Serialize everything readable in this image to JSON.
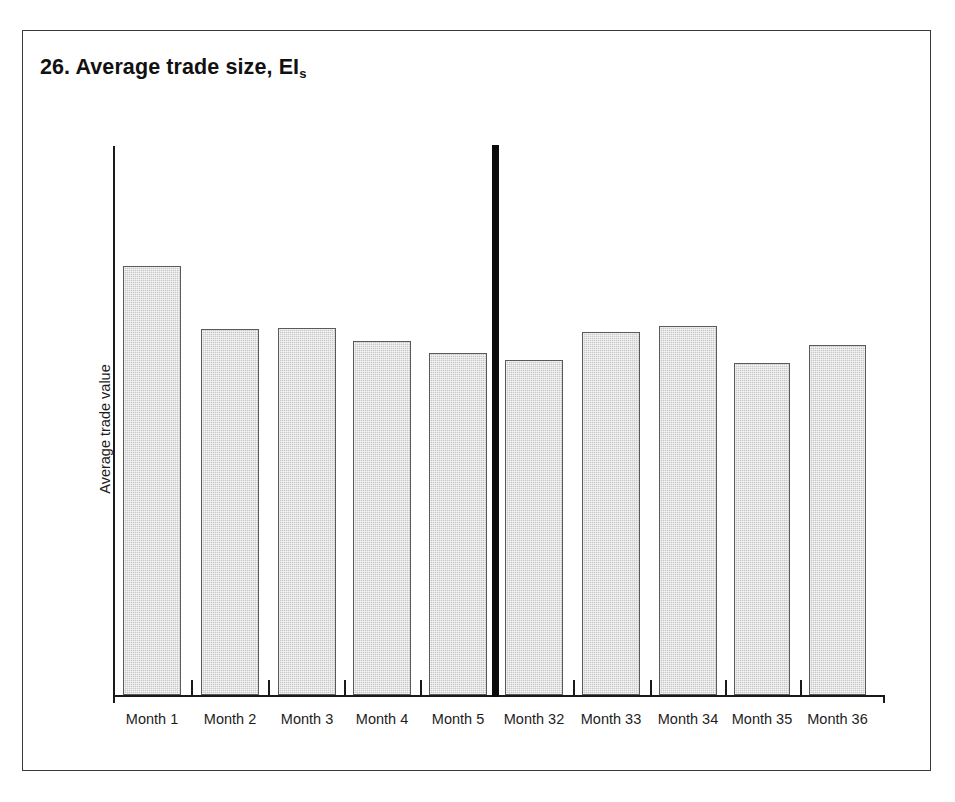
{
  "figure": {
    "title_number": "26.",
    "title_text": "26. Average trade size, EI",
    "title_subscript": "s"
  },
  "chart_data": {
    "type": "bar",
    "title": "26. Average trade size, EIs",
    "xlabel": "",
    "ylabel": "Average trade value",
    "grid": false,
    "legend": null,
    "axis_tick_labels_y": [],
    "categories": [
      "Month 1",
      "Month 2",
      "Month 3",
      "Month 4",
      "Month 5",
      "Month 32",
      "Month 33",
      "Month 34",
      "Month 35",
      "Month 36"
    ],
    "values": [
      78.5,
      66.7,
      67.0,
      64.5,
      62.3,
      61.1,
      66.2,
      67.3,
      60.5,
      63.8
    ],
    "ylim": [
      0,
      100
    ],
    "groups": [
      {
        "name": "first-period",
        "categories": [
          "Month 1",
          "Month 2",
          "Month 3",
          "Month 4",
          "Month 5"
        ]
      },
      {
        "name": "second-period",
        "categories": [
          "Month 32",
          "Month 33",
          "Month 34",
          "Month 35",
          "Month 36"
        ]
      }
    ],
    "group_separator": true,
    "bar_fill_color": "#c9c9c9",
    "bar_edge_color": "#5a5a5a",
    "axis_color": "#1a1a1a"
  },
  "bars": [
    {
      "label": "Month 1",
      "left": 100,
      "width": 58,
      "top": 235,
      "height": 429
    },
    {
      "label": "Month 2",
      "left": 178,
      "width": 58,
      "top": 298,
      "height": 366
    },
    {
      "label": "Month 3",
      "left": 255,
      "width": 58,
      "top": 297,
      "height": 367
    },
    {
      "label": "Month 4",
      "left": 330,
      "width": 58,
      "top": 310,
      "height": 354
    },
    {
      "label": "Month 5",
      "left": 406,
      "width": 58,
      "top": 322,
      "height": 342
    },
    {
      "label": "Month 32",
      "left": 482,
      "width": 58,
      "top": 329,
      "height": 335
    },
    {
      "label": "Month 33",
      "left": 559,
      "width": 58,
      "top": 301,
      "height": 363
    },
    {
      "label": "Month 34",
      "left": 636,
      "width": 58,
      "top": 295,
      "height": 369
    },
    {
      "label": "Month 35",
      "left": 711,
      "width": 56,
      "top": 332,
      "height": 332
    },
    {
      "label": "Month 36",
      "left": 786,
      "width": 57,
      "top": 314,
      "height": 350
    }
  ],
  "ticks": [
    {
      "left": 168
    },
    {
      "left": 245
    },
    {
      "left": 321
    },
    {
      "left": 397
    },
    {
      "left": 550
    },
    {
      "left": 627
    },
    {
      "left": 702
    },
    {
      "left": 777
    }
  ]
}
